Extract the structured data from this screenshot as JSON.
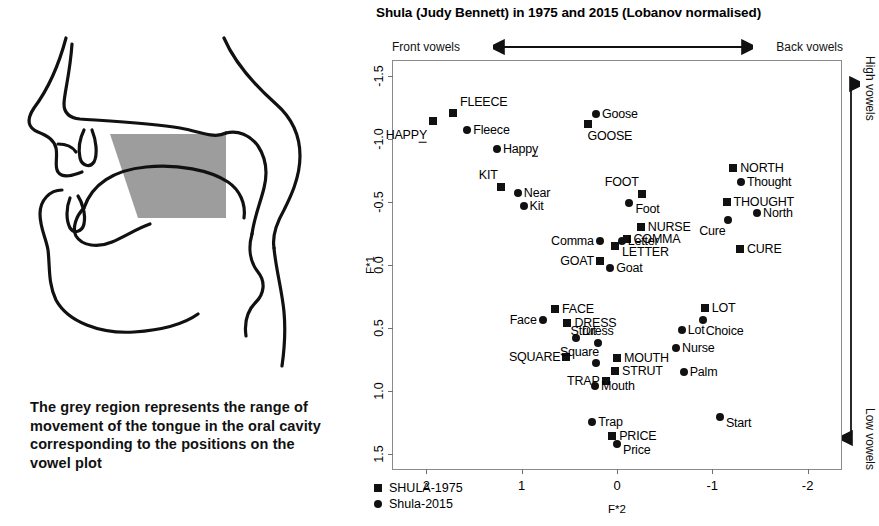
{
  "chart_data": {
    "type": "scatter",
    "title": "Shula (Judy Bennett) in 1975 and 2015 (Lobanov normalised)",
    "xlabel": "F*2",
    "ylabel": "F*1",
    "xlim": [
      2.35,
      -2.35
    ],
    "ylim": [
      -1.62,
      1.62
    ],
    "xticks": [
      "2",
      "1",
      "0",
      "-1",
      "-2"
    ],
    "xtick_values": [
      2,
      1,
      0,
      -1,
      -2
    ],
    "yticks": [
      "-1.5",
      "-1.0",
      "-0.5",
      "0.0",
      "0.5",
      "1.0",
      "1.5"
    ],
    "ytick_values": [
      -1.5,
      -1.0,
      -0.5,
      0.0,
      0.5,
      1.0,
      1.5
    ],
    "grid": false,
    "axis_annotations": {
      "top_left": "Front vowels",
      "top_right": "Back vowels",
      "right_top": "High vowels",
      "right_bottom": "Low vowels"
    },
    "legend": {
      "position": "bottom-left-inside",
      "entries": [
        {
          "label": "SHULA-1975",
          "marker": "square"
        },
        {
          "label": "Shula-2015",
          "marker": "circle"
        }
      ]
    },
    "series": [
      {
        "name": "SHULA-1975",
        "marker": "square",
        "label_case": "upper",
        "points": [
          {
            "label": "HAPPY",
            "x": 1.93,
            "y": -1.14,
            "lx": -6,
            "ly": 14,
            "align": "right",
            "underline_last": true
          },
          {
            "label": "FLEECE",
            "x": 1.72,
            "y": -1.21,
            "lx": 7,
            "ly": -11,
            "align": "left"
          },
          {
            "label": "KIT",
            "x": 1.22,
            "y": -0.62,
            "lx": -3,
            "ly": -12,
            "align": "right"
          },
          {
            "label": "GOOSE",
            "x": 0.3,
            "y": -1.12,
            "lx": -1,
            "ly": 12,
            "align": "left"
          },
          {
            "label": "FOOT",
            "x": -0.26,
            "y": -0.56,
            "lx": -3,
            "ly": -12,
            "align": "right"
          },
          {
            "label": "NORTH",
            "x": -1.22,
            "y": -0.77,
            "lx": 7,
            "ly": 0,
            "align": "left"
          },
          {
            "label": "THOUGHT",
            "x": -1.15,
            "y": -0.5,
            "lx": 7,
            "ly": 0,
            "align": "left"
          },
          {
            "label": "CURE",
            "x": -1.29,
            "y": -0.13,
            "lx": 7,
            "ly": 0,
            "align": "left"
          },
          {
            "label": "NURSE",
            "x": -0.25,
            "y": -0.3,
            "lx": 7,
            "ly": 0,
            "align": "left"
          },
          {
            "label": "COMMA",
            "x": -0.1,
            "y": -0.21,
            "lx": 7,
            "ly": 0,
            "align": "left"
          },
          {
            "label": "LETTER",
            "x": 0.02,
            "y": -0.15,
            "lx": 7,
            "ly": 6,
            "align": "left"
          },
          {
            "label": "GOAT",
            "x": 0.18,
            "y": -0.03,
            "lx": -6,
            "ly": 0,
            "align": "right"
          },
          {
            "label": "FACE",
            "x": 0.65,
            "y": 0.35,
            "lx": 7,
            "ly": 0,
            "align": "left"
          },
          {
            "label": "DRESS",
            "x": 0.52,
            "y": 0.46,
            "lx": 7,
            "ly": 0,
            "align": "left"
          },
          {
            "label": "SQUARE",
            "x": 0.53,
            "y": 0.73,
            "lx": -6,
            "ly": 0,
            "align": "right"
          },
          {
            "label": "LOT",
            "x": -0.92,
            "y": 0.34,
            "lx": 7,
            "ly": 0,
            "align": "left"
          },
          {
            "label": "MOUTH",
            "x": 0.0,
            "y": 0.74,
            "lx": 7,
            "ly": 0,
            "align": "left"
          },
          {
            "label": "STRUT",
            "x": 0.02,
            "y": 0.84,
            "lx": 7,
            "ly": 0,
            "align": "left"
          },
          {
            "label": "TRAP",
            "x": 0.12,
            "y": 0.92,
            "lx": -6,
            "ly": 0,
            "align": "right"
          },
          {
            "label": "PRICE",
            "x": 0.05,
            "y": 1.36,
            "lx": 7,
            "ly": 0,
            "align": "left"
          }
        ]
      },
      {
        "name": "Shula-2015",
        "marker": "circle",
        "label_case": "lower",
        "points": [
          {
            "label": "Fleece",
            "x": 1.57,
            "y": -1.07,
            "lx": 6,
            "ly": 0,
            "align": "left"
          },
          {
            "label": "Happy",
            "x": 1.26,
            "y": -0.92,
            "lx": 6,
            "ly": 0,
            "align": "left",
            "underline_last": true
          },
          {
            "label": "Near",
            "x": 1.04,
            "y": -0.57,
            "lx": 6,
            "ly": 0,
            "align": "left"
          },
          {
            "label": "Kit",
            "x": 0.98,
            "y": -0.47,
            "lx": 6,
            "ly": 0,
            "align": "left"
          },
          {
            "label": "Goose",
            "x": 0.22,
            "y": -1.2,
            "lx": 6,
            "ly": 0,
            "align": "left"
          },
          {
            "label": "Foot",
            "x": -0.13,
            "y": -0.49,
            "lx": 6,
            "ly": 6,
            "align": "left"
          },
          {
            "label": "Thought",
            "x": -1.3,
            "y": -0.66,
            "lx": 6,
            "ly": 0,
            "align": "left"
          },
          {
            "label": "North",
            "x": -1.47,
            "y": -0.41,
            "lx": 6,
            "ly": 0,
            "align": "left"
          },
          {
            "label": "Cure",
            "x": -1.16,
            "y": -0.36,
            "lx": -2,
            "ly": 11,
            "align": "right"
          },
          {
            "label": "Comma",
            "x": 0.18,
            "y": -0.19,
            "lx": -6,
            "ly": 0,
            "align": "right"
          },
          {
            "label": "Letter",
            "x": -0.05,
            "y": -0.19,
            "lx": 6,
            "ly": 0,
            "align": "left"
          },
          {
            "label": "Goat",
            "x": 0.07,
            "y": 0.02,
            "lx": 6,
            "ly": 0,
            "align": "left"
          },
          {
            "label": "Face",
            "x": 0.78,
            "y": 0.44,
            "lx": -6,
            "ly": 0,
            "align": "right"
          },
          {
            "label": "Dress",
            "x": 0.43,
            "y": 0.58,
            "lx": 6,
            "ly": -7,
            "align": "left"
          },
          {
            "label": "Square",
            "x": 0.22,
            "y": 0.78,
            "lx": 3,
            "ly": -11,
            "align": "right"
          },
          {
            "label": "Strut",
            "x": 0.2,
            "y": 0.62,
            "lx": -2,
            "ly": -12,
            "align": "right"
          },
          {
            "label": "Mouth",
            "x": 0.23,
            "y": 0.96,
            "lx": 6,
            "ly": 0,
            "align": "left"
          },
          {
            "label": "Trap",
            "x": 0.26,
            "y": 1.25,
            "lx": 6,
            "ly": 0,
            "align": "left"
          },
          {
            "label": "Price",
            "x": 0.0,
            "y": 1.42,
            "lx": 6,
            "ly": 6,
            "align": "left"
          },
          {
            "label": "Lot",
            "x": -0.68,
            "y": 0.52,
            "lx": 6,
            "ly": 0,
            "align": "left"
          },
          {
            "label": "Choice",
            "x": -0.9,
            "y": 0.44,
            "lx": 3,
            "ly": 11,
            "align": "left"
          },
          {
            "label": "Nurse",
            "x": -0.62,
            "y": 0.66,
            "lx": 6,
            "ly": 0,
            "align": "left"
          },
          {
            "label": "Palm",
            "x": -0.7,
            "y": 0.85,
            "lx": 6,
            "ly": 0,
            "align": "left"
          },
          {
            "label": "Start",
            "x": -1.08,
            "y": 1.21,
            "lx": 6,
            "ly": 6,
            "align": "left"
          }
        ]
      }
    ]
  },
  "diagram": {
    "caption": "The grey region represents the range of movement of the tongue in the oral cavity corresponding to the positions on the vowel plot",
    "region_fill": "#9d9d9d",
    "outline_color": "#111111",
    "name": "sagittal-vocal-tract"
  }
}
